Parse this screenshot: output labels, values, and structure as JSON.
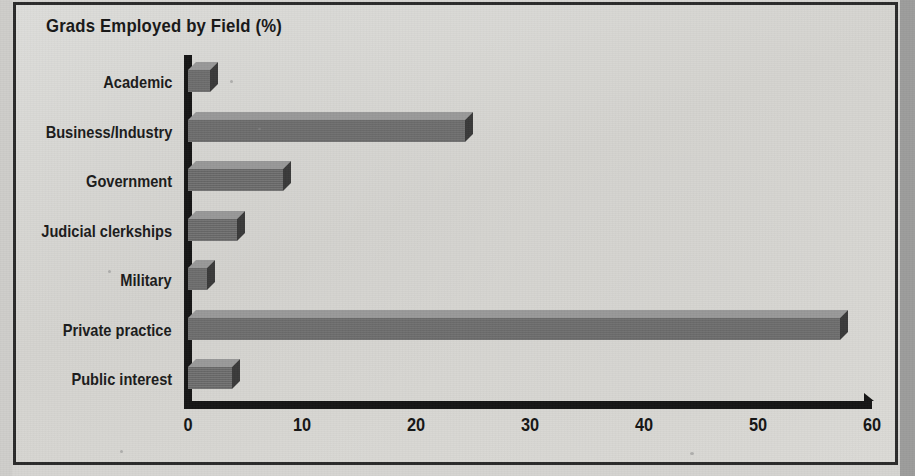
{
  "figure": {
    "title": "Grads Employed by Field (%)",
    "frame_color": "#2a2a2a",
    "paper_color": "#d6d5d2"
  },
  "chart_data": {
    "type": "bar",
    "orientation": "horizontal",
    "title": "Grads Employed by Field (%)",
    "xlabel": "",
    "ylabel": "",
    "categories": [
      "Academic",
      "Business/Industry",
      "Government",
      "Judicial clerkships",
      "Military",
      "Private practice",
      "Public interest"
    ],
    "values": [
      1.9,
      24.3,
      8.3,
      4.3,
      1.7,
      57.2,
      3.9
    ],
    "xlim": [
      0,
      60
    ],
    "xticks": [
      0,
      10,
      20,
      30,
      40,
      50,
      60
    ],
    "xtick_labels": [
      "0",
      "10",
      "20",
      "30",
      "40",
      "50",
      "60"
    ],
    "grid": false,
    "legend": false,
    "bar_style": "3d-extruded",
    "bar_face_color": "#6e6e6e",
    "bar_top_color": "#9a9a9a",
    "bar_side_color": "#3a3a3a",
    "axis_color": "#151515"
  }
}
